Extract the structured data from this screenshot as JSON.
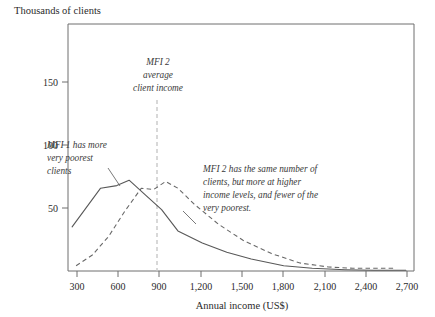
{
  "figure": {
    "ylabel": "Thousands of clients",
    "xlabel": "Annual income (US$)"
  },
  "annotations": {
    "marker": {
      "line1": "MFI 2",
      "line2": "average",
      "line3": "client income",
      "at_x": 870
    },
    "mfi1": {
      "line1": "MFI 1 has more",
      "line2": "very poorest",
      "line3": "clients"
    },
    "mfi2": {
      "line1": "MFI 2 has the same number of",
      "line2": "clients, but more at higher",
      "line3": "income levels, and fewer of the",
      "line4": "very poorest."
    }
  },
  "colors": {
    "frame": "#6e6e6e",
    "solid_series": "#585858",
    "dashed_series": "#686868",
    "marker": "#c8c8c8",
    "text": "#2b2b2b"
  },
  "chart_data": {
    "type": "line",
    "title": "",
    "xlabel": "Annual income (US$)",
    "ylabel": "Thousands of clients",
    "xlim": [
      210,
      2760
    ],
    "ylim": [
      0,
      185
    ],
    "xticks": [
      300,
      600,
      900,
      1200,
      1500,
      1800,
      2100,
      2400,
      2700
    ],
    "xtick_labels": [
      "300",
      "600",
      "900",
      "1,200",
      "1,500",
      "1,800",
      "2,100",
      "2,400",
      "2,700"
    ],
    "yticks": [
      50,
      100,
      150
    ],
    "ytick_labels": [
      "50",
      "100",
      "150"
    ],
    "grid": false,
    "legend": "none",
    "series": [
      {
        "name": "MFI 1",
        "style": "solid",
        "x": [
          240,
          450,
          570,
          660,
          780,
          900,
          1020,
          1200,
          1380,
          1560,
          1800,
          2010,
          2250,
          2460,
          2700
        ],
        "y": [
          33,
          62,
          64,
          68,
          57,
          46,
          30,
          21,
          14,
          9,
          4,
          2,
          1,
          0.5,
          0.5
        ]
      },
      {
        "name": "MFI 2",
        "style": "dashed",
        "x": [
          270,
          390,
          510,
          630,
          750,
          840,
          930,
          1020,
          1140,
          1320,
          1500,
          1710,
          1920,
          2130,
          2310,
          2460,
          2610
        ],
        "y": [
          4,
          12,
          26,
          45,
          62,
          61,
          67,
          62,
          50,
          35,
          23,
          13,
          6,
          3,
          2,
          2,
          2
        ]
      }
    ]
  }
}
